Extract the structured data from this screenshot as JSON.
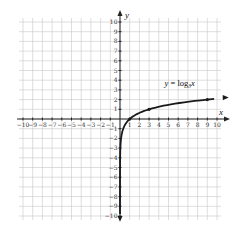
{
  "chart_data": {
    "type": "line",
    "title": "",
    "xlabel": "x",
    "ylabel": "y",
    "xlim": [
      -10,
      10
    ],
    "ylim": [
      -10,
      10
    ],
    "grid": true,
    "x_ticks": [
      -10,
      -9,
      -8,
      -7,
      -6,
      -5,
      -4,
      -3,
      -2,
      -1,
      1,
      2,
      3,
      4,
      5,
      6,
      7,
      8,
      9,
      10
    ],
    "y_ticks": [
      -10,
      -9,
      -8,
      -7,
      -6,
      -5,
      -4,
      -3,
      -2,
      -1,
      1,
      2,
      3,
      4,
      5,
      6,
      7,
      8,
      9,
      10
    ],
    "series": [
      {
        "name": "y = log_3 x",
        "label": "y = log",
        "label_sub": "3",
        "label_tail": "x",
        "function": "log3(x)",
        "x": [
          0.01,
          0.05,
          0.1,
          0.2,
          0.333,
          0.5,
          1,
          2,
          3,
          4,
          5,
          6,
          7,
          8,
          9,
          10
        ],
        "y": [
          -4.19,
          -2.73,
          -2.1,
          -1.46,
          -1.0,
          -0.63,
          0,
          0.63,
          1,
          1.26,
          1.46,
          1.63,
          1.77,
          1.89,
          2,
          2.1
        ],
        "marked_points": [
          {
            "x": 1,
            "y": 0
          },
          {
            "x": 3,
            "y": 1
          },
          {
            "x": 9,
            "y": 2
          }
        ]
      }
    ],
    "legend": "inline label near curve, above x=3..5"
  }
}
